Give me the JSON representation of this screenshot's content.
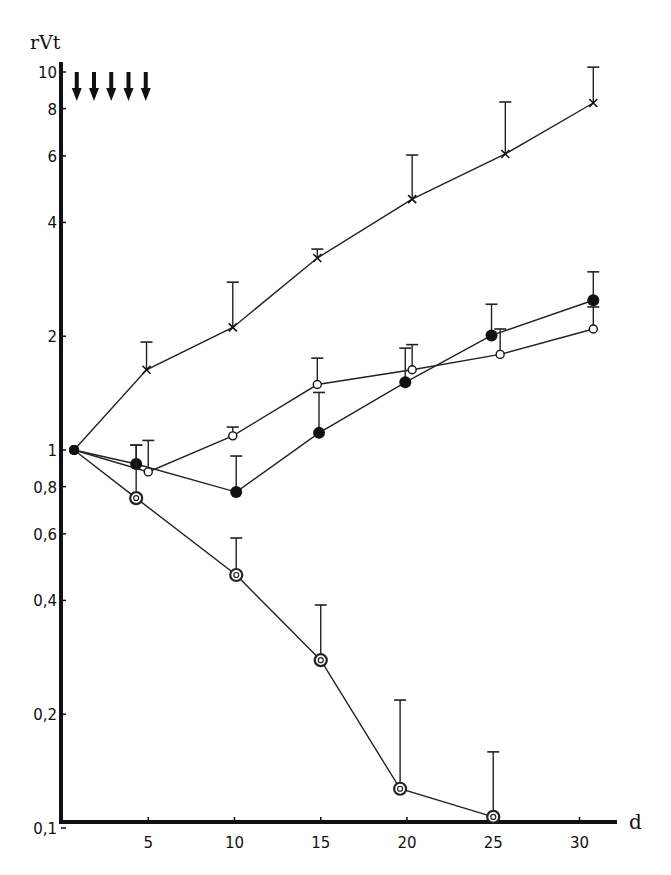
{
  "chart_data": {
    "type": "line",
    "title": "",
    "xlabel": "d",
    "ylabel": "rVt",
    "yscale": "log",
    "ylim": [
      0.1,
      10
    ],
    "xlim": [
      0,
      32
    ],
    "grid": false,
    "legend": null,
    "x_ticks": [
      5,
      10,
      15,
      20,
      25,
      30
    ],
    "x_tick_labels": [
      "5",
      "10",
      "15",
      "20",
      "25",
      "30"
    ],
    "y_ticks": [
      0.1,
      0.2,
      0.4,
      0.6,
      0.8,
      1,
      2,
      4,
      6,
      8,
      10
    ],
    "y_tick_labels": [
      "0,1",
      "0,2",
      "0,4",
      "0,6",
      "0,8",
      "1",
      "2",
      "4",
      "6",
      "8",
      "10"
    ],
    "annotations": {
      "treatment_arrows_days": [
        1,
        2,
        3,
        4,
        5
      ],
      "arrow_glyph": "down-arrow"
    },
    "series": [
      {
        "name": "cross",
        "marker": "x",
        "points": [
          {
            "x": 0.7,
            "y": 1.0
          },
          {
            "x": 4.9,
            "y": 1.63,
            "err_upper": 1.93
          },
          {
            "x": 9.9,
            "y": 2.11,
            "err_upper": 2.78
          },
          {
            "x": 14.8,
            "y": 3.22,
            "err_upper": 3.4
          },
          {
            "x": 20.3,
            "y": 4.61,
            "err_upper": 6.03
          },
          {
            "x": 25.7,
            "y": 6.07,
            "err_upper": 8.33
          },
          {
            "x": 30.8,
            "y": 8.28,
            "err_upper": 10.3
          }
        ]
      },
      {
        "name": "open-circle",
        "marker": "open-circle",
        "points": [
          {
            "x": 0.7,
            "y": 1.0
          },
          {
            "x": 5.0,
            "y": 0.875,
            "err_upper": 1.06
          },
          {
            "x": 9.9,
            "y": 1.09,
            "err_upper": 1.15
          },
          {
            "x": 14.8,
            "y": 1.49,
            "err_upper": 1.75
          },
          {
            "x": 20.3,
            "y": 1.63,
            "err_upper": 1.9
          },
          {
            "x": 25.4,
            "y": 1.79,
            "err_upper": 2.09
          },
          {
            "x": 30.8,
            "y": 2.09,
            "err_upper": 2.39
          }
        ]
      },
      {
        "name": "filled-circle",
        "marker": "filled-circle",
        "points": [
          {
            "x": 0.7,
            "y": 1.0
          },
          {
            "x": 4.3,
            "y": 0.918,
            "err_upper": 1.03
          },
          {
            "x": 10.1,
            "y": 0.774,
            "err_upper": 0.964
          },
          {
            "x": 14.9,
            "y": 1.11,
            "err_upper": 1.42
          },
          {
            "x": 19.9,
            "y": 1.51,
            "err_upper": 1.86
          },
          {
            "x": 24.9,
            "y": 2.01,
            "err_upper": 2.43
          },
          {
            "x": 30.8,
            "y": 2.49,
            "err_upper": 2.96
          }
        ]
      },
      {
        "name": "target-circle",
        "marker": "double-circle",
        "points": [
          {
            "x": 0.7,
            "y": 1.0
          },
          {
            "x": 4.3,
            "y": 0.746,
            "err_upper": 1.03
          },
          {
            "x": 10.1,
            "y": 0.467,
            "err_upper": 0.585
          },
          {
            "x": 15.0,
            "y": 0.278,
            "err_upper": 0.389
          },
          {
            "x": 19.6,
            "y": 0.127,
            "err_upper": 0.218
          },
          {
            "x": 25.0,
            "y": 0.107,
            "err_upper": 0.159
          }
        ]
      }
    ]
  }
}
